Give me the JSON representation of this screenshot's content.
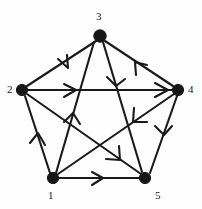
{
  "figure": {
    "background_color": "#fefefe",
    "stroke_color": "#1a1a1a",
    "vertex_color": "#161616"
  },
  "graph": {
    "type": "directed-graph",
    "vertex_count": 5,
    "edge_count": 10,
    "vertices": [
      {
        "id": "1",
        "label": "1",
        "cx": 53,
        "cy": 178,
        "r": 5.6,
        "label_x": 46,
        "label_y": 189
      },
      {
        "id": "2",
        "label": "2",
        "cx": 22,
        "cy": 90,
        "r": 5.6,
        "label_x": 7,
        "label_y": 85
      },
      {
        "id": "3",
        "label": "3",
        "cx": 100,
        "cy": 36,
        "r": 6.2,
        "label_x": 96,
        "label_y": 17
      },
      {
        "id": "4",
        "label": "4",
        "cx": 178,
        "cy": 90,
        "r": 5.6,
        "label_x": 188,
        "label_y": 85
      },
      {
        "id": "5",
        "label": "5",
        "cx": 145,
        "cy": 178,
        "r": 5.6,
        "label_x": 155,
        "label_y": 189
      }
    ],
    "edges": [
      {
        "id": "e-3-2",
        "from": "3",
        "to": "2",
        "kind": "outer-pentagon",
        "arrow_count": 1
      },
      {
        "id": "e-4-3",
        "from": "4",
        "to": "3",
        "kind": "outer-pentagon",
        "arrow_count": 1
      },
      {
        "id": "e-1-2",
        "from": "1",
        "to": "2",
        "kind": "outer-pentagon",
        "arrow_count": 1
      },
      {
        "id": "e-4-5",
        "from": "4",
        "to": "5",
        "kind": "outer-pentagon",
        "arrow_count": 1
      },
      {
        "id": "e-1-5",
        "from": "1",
        "to": "5",
        "kind": "outer-pentagon",
        "arrow_count": 1
      },
      {
        "id": "e-2-4",
        "from": "2",
        "to": "4",
        "kind": "chord",
        "arrow_count": 2
      },
      {
        "id": "e-1-3",
        "from": "1",
        "to": "3",
        "kind": "chord",
        "arrow_count": 1
      },
      {
        "id": "e-3-5",
        "from": "3",
        "to": "5",
        "kind": "chord",
        "arrow_count": 1
      },
      {
        "id": "e-2-5",
        "from": "2",
        "to": "5",
        "kind": "chord",
        "arrow_count": 1
      },
      {
        "id": "e-4-1",
        "from": "4",
        "to": "1",
        "kind": "chord",
        "arrow_count": 1
      }
    ]
  }
}
